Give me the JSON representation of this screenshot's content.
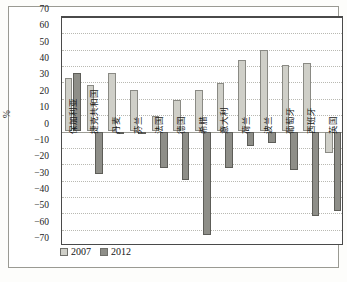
{
  "chart_data": {
    "type": "bar",
    "title": "",
    "xlabel": "",
    "ylabel": "%",
    "ylim": [
      -70,
      70
    ],
    "ytick_step": 10,
    "grid": true,
    "legend_position": "bottom-left",
    "categories": [
      "保加利亚",
      "捷克共和国",
      "丹麦",
      "芬兰",
      "法国",
      "德国",
      "希腊",
      "意大利",
      "荷兰",
      "波兰",
      "葡萄牙",
      "西班牙",
      "英国"
    ],
    "yticks": [
      70,
      60,
      50,
      40,
      30,
      20,
      10,
      0,
      -10,
      -20,
      -30,
      -40,
      -50,
      -60,
      -70
    ],
    "ytick_labels": [
      "70",
      "60",
      "50",
      "40",
      "30",
      "20",
      "10",
      "0",
      "−10",
      "−20",
      "−30",
      "−40",
      "−50",
      "−60",
      "−70"
    ],
    "series": [
      {
        "name": "2007",
        "color": "#cfcfc8",
        "values": [
          32.7,
          28.6,
          35.6,
          25.2,
          9.5,
          19.4,
          25.5,
          29.4,
          43.7,
          49.6,
          40.7,
          41.7,
          -13.0
        ]
      },
      {
        "name": "2012",
        "color": "#8e8e88",
        "values": [
          36.0,
          -26.1,
          -1.8,
          -0.6,
          -22.4,
          -29.4,
          -63.0,
          -22.4,
          -8.6,
          -6.8,
          -23.8,
          -51.6,
          -48.8
        ]
      }
    ]
  },
  "legend": {
    "items": [
      {
        "label": "2007",
        "series": "s2007"
      },
      {
        "label": "2012",
        "series": "s2012"
      }
    ]
  },
  "axis": {
    "y_title": "%"
  },
  "caption": {
    "text": ""
  }
}
